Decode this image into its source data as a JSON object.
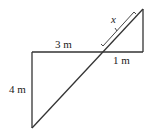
{
  "diagram": {
    "labels": {
      "top_segment": "3 m",
      "right_segment": "1 m",
      "left_side": "4 m",
      "unknown": "x"
    },
    "colors": {
      "line": "#333333",
      "background": "#ffffff"
    }
  }
}
